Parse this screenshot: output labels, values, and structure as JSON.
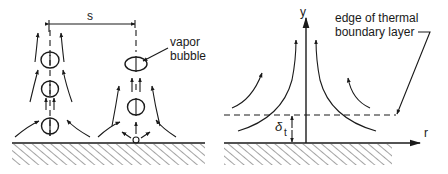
{
  "figure": {
    "left_panel": {
      "title": "Bubble columns at nucleation sites",
      "spacing_label": "s",
      "bubble_label_line1": "vapor",
      "bubble_label_line2": "bubble"
    },
    "right_panel": {
      "title": "Thermal boundary layer near plume",
      "y_axis_label": "y",
      "r_axis_label": "r",
      "delta_symbol": "δ",
      "delta_subscript": "t",
      "annotation_line1": "edge of thermal",
      "annotation_line2": "boundary layer"
    },
    "colors": {
      "ink": "#1a1a1a",
      "background": "#ffffff"
    }
  }
}
